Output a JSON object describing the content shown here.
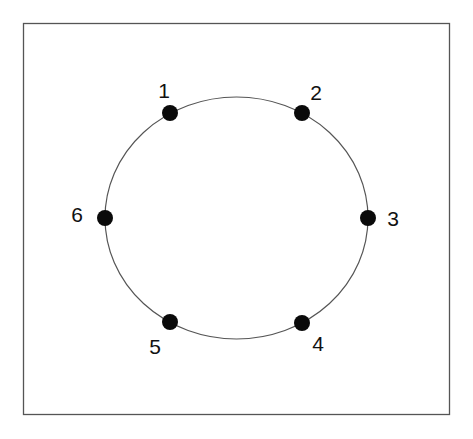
{
  "diagram": {
    "type": "ring-graph",
    "frame": {
      "x": 23.5,
      "y": 23.5,
      "width": 426,
      "height": 391,
      "stroke": "#555555"
    },
    "ring": {
      "cx": 236.5,
      "cy": 218,
      "rx": 131.5,
      "ry": 121,
      "stroke": "#555555"
    },
    "node_color": "#0a0a0a",
    "node_radius": 8,
    "nodes": [
      {
        "id": "1",
        "label": "1",
        "x": 170,
        "y": 113,
        "label_x": 164,
        "label_y": 98
      },
      {
        "id": "2",
        "label": "2",
        "x": 302,
        "y": 113,
        "label_x": 316,
        "label_y": 100
      },
      {
        "id": "3",
        "label": "3",
        "x": 368,
        "y": 218,
        "label_x": 393,
        "label_y": 226
      },
      {
        "id": "4",
        "label": "4",
        "x": 302,
        "y": 323,
        "label_x": 318,
        "label_y": 351
      },
      {
        "id": "5",
        "label": "5",
        "x": 170,
        "y": 322,
        "label_x": 155,
        "label_y": 354
      },
      {
        "id": "6",
        "label": "6",
        "x": 105,
        "y": 218,
        "label_x": 77,
        "label_y": 222
      }
    ]
  }
}
